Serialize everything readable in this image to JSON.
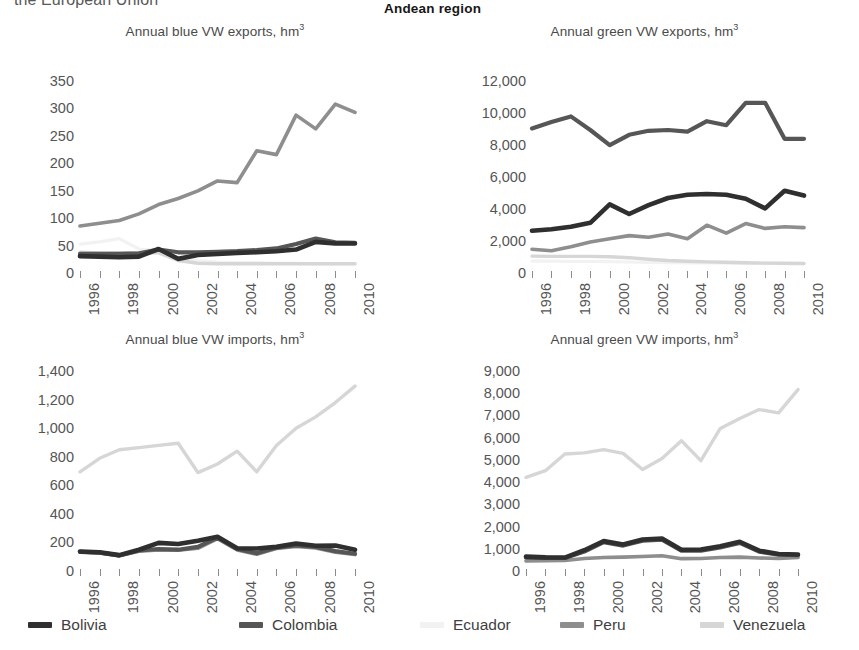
{
  "header": {
    "left_text": "the European Union",
    "right_text": "Andean region"
  },
  "legend": {
    "items": [
      {
        "label": "Bolivia",
        "color": "#2f2f2f"
      },
      {
        "label": "Colombia",
        "color": "#565656"
      },
      {
        "label": "Ecuador",
        "color": "#f2f2f2"
      },
      {
        "label": "Peru",
        "color": "#8e8e8e"
      },
      {
        "label": "Venezuela",
        "color": "#d6d6d6"
      }
    ]
  },
  "series_colors": {
    "Bolivia": "#2f2f2f",
    "Colombia": "#565656",
    "Ecuador": "#f2f2f2",
    "Peru": "#8e8e8e",
    "Venezuela": "#d6d6d6"
  },
  "x": [
    1996,
    1997,
    1998,
    1999,
    2000,
    2001,
    2002,
    2003,
    2004,
    2005,
    2006,
    2007,
    2008,
    2009,
    2010
  ],
  "x_tick_labels": [
    "1996",
    "",
    "1998",
    "",
    "2000",
    "",
    "2002",
    "",
    "2004",
    "",
    "2006",
    "",
    "2008",
    "",
    "2010"
  ],
  "chart_data": [
    {
      "id": "blue-exports",
      "type": "line",
      "title": "Annual blue VW exports, hm",
      "title_sup": "3",
      "xlabel": "",
      "ylabel": "",
      "ylim": [
        0,
        350
      ],
      "yticks": [
        0,
        50,
        100,
        150,
        200,
        250,
        300,
        350
      ],
      "ytick_labels": [
        "0",
        "50",
        "100",
        "150",
        "200",
        "250",
        "300",
        "350"
      ],
      "grid": false,
      "categories": [
        1996,
        1997,
        1998,
        1999,
        2000,
        2001,
        2002,
        2003,
        2004,
        2005,
        2006,
        2007,
        2008,
        2009,
        2010
      ],
      "series": [
        {
          "name": "Bolivia",
          "values": [
            18,
            17,
            16,
            17,
            31,
            13,
            20,
            22,
            24,
            25,
            27,
            30,
            44,
            41,
            41
          ]
        },
        {
          "name": "Colombia",
          "values": [
            22,
            22,
            22,
            23,
            30,
            25,
            25,
            26,
            27,
            29,
            32,
            40,
            50,
            43,
            42
          ]
        },
        {
          "name": "Ecuador",
          "values": [
            40,
            44,
            50,
            31,
            28,
            16,
            10,
            7,
            6,
            6,
            5,
            5,
            4,
            4,
            4
          ]
        },
        {
          "name": "Peru",
          "values": [
            73,
            78,
            83,
            95,
            112,
            123,
            137,
            155,
            152,
            210,
            203,
            275,
            250,
            295,
            280
          ]
        },
        {
          "name": "Venezuela",
          "values": [
            25,
            24,
            24,
            24,
            24,
            10,
            5,
            4,
            4,
            4,
            4,
            4,
            4,
            4,
            4
          ]
        }
      ]
    },
    {
      "id": "green-exports",
      "type": "line",
      "title": "Annual green VW exports, hm",
      "title_sup": "3",
      "xlabel": "",
      "ylabel": "",
      "ylim": [
        0,
        12000
      ],
      "yticks": [
        0,
        2000,
        4000,
        6000,
        8000,
        10000,
        12000
      ],
      "ytick_labels": [
        "0",
        "2,000",
        "4,000",
        "6,000",
        "8,000",
        "10,000",
        "12,000"
      ],
      "grid": false,
      "categories": [
        1996,
        1997,
        1998,
        1999,
        2000,
        2001,
        2002,
        2003,
        2004,
        2005,
        2006,
        2007,
        2008,
        2009,
        2010
      ],
      "series": [
        {
          "name": "Bolivia",
          "values": [
            2200,
            2300,
            2450,
            2700,
            3850,
            3250,
            3800,
            4250,
            4450,
            4500,
            4450,
            4200,
            3600,
            4700,
            4400
          ]
        },
        {
          "name": "Colombia",
          "values": [
            8600,
            9000,
            9350,
            8500,
            7550,
            8200,
            8450,
            8500,
            8400,
            9050,
            8800,
            10200,
            10200,
            7950,
            7950
          ]
        },
        {
          "name": "Ecuador",
          "values": [
            300,
            300,
            280,
            280,
            270,
            250,
            230,
            210,
            200,
            190,
            180,
            170,
            160,
            150,
            150
          ]
        },
        {
          "name": "Peru",
          "values": [
            1050,
            950,
            1200,
            1500,
            1700,
            1900,
            1800,
            2000,
            1700,
            2550,
            2050,
            2650,
            2350,
            2450,
            2400
          ]
        },
        {
          "name": "Venezuela",
          "values": [
            620,
            600,
            600,
            600,
            580,
            520,
            420,
            340,
            300,
            260,
            230,
            200,
            180,
            170,
            160
          ]
        }
      ]
    },
    {
      "id": "blue-imports",
      "type": "line",
      "title": "Annual blue VW imports, hm",
      "title_sup": "3",
      "xlabel": "",
      "ylabel": "",
      "ylim": [
        0,
        1400
      ],
      "yticks": [
        0,
        200,
        400,
        600,
        800,
        1000,
        1200,
        1400
      ],
      "ytick_labels": [
        "0",
        "200",
        "400",
        "600",
        "800",
        "1,000",
        "1,200",
        "1,400"
      ],
      "grid": false,
      "categories": [
        1996,
        1997,
        1998,
        1999,
        2000,
        2001,
        2002,
        2003,
        2004,
        2005,
        2006,
        2007,
        2008,
        2009,
        2010
      ],
      "series": [
        {
          "name": "Bolivia",
          "values": [
            88,
            82,
            62,
            100,
            148,
            140,
            163,
            190,
            110,
            108,
            120,
            143,
            128,
            130,
            100
          ]
        },
        {
          "name": "Colombia",
          "values": [
            85,
            80,
            60,
            95,
            105,
            100,
            120,
            185,
            105,
            75,
            115,
            130,
            120,
            90,
            72
          ]
        },
        {
          "name": "Ecuador",
          "values": [
            85,
            78,
            58,
            92,
            100,
            98,
            112,
            180,
            100,
            70,
            110,
            125,
            115,
            85,
            68
          ]
        },
        {
          "name": "Peru",
          "values": [
            84,
            77,
            57,
            90,
            98,
            96,
            110,
            178,
            98,
            68,
            108,
            122,
            112,
            83,
            66
          ]
        },
        {
          "name": "Venezuela",
          "values": [
            645,
            740,
            800,
            815,
            830,
            845,
            640,
            700,
            790,
            645,
            830,
            950,
            1030,
            1130,
            1245
          ]
        }
      ]
    },
    {
      "id": "green-imports",
      "type": "line",
      "title": "Annual green VW imports, hm",
      "title_sup": "3",
      "xlabel": "",
      "ylabel": "",
      "ylim": [
        0,
        9000
      ],
      "yticks": [
        0,
        1000,
        2000,
        3000,
        4000,
        5000,
        6000,
        7000,
        8000,
        9000
      ],
      "ytick_labels": [
        "0",
        "1,000",
        "2,000",
        "3,000",
        "4,000",
        "5,000",
        "6,000",
        "7,000",
        "8,000",
        "9,000"
      ],
      "grid": false,
      "categories": [
        1996,
        1997,
        1998,
        1999,
        2000,
        2001,
        2002,
        2003,
        2004,
        2005,
        2006,
        2007,
        2008,
        2009,
        2010
      ],
      "series": [
        {
          "name": "Bolivia",
          "values": [
            330,
            300,
            290,
            620,
            1030,
            880,
            1100,
            1150,
            640,
            650,
            800,
            1000,
            600,
            450,
            430
          ]
        },
        {
          "name": "Colombia",
          "values": [
            300,
            280,
            270,
            560,
            980,
            830,
            1050,
            1100,
            600,
            600,
            750,
            950,
            560,
            420,
            400
          ]
        },
        {
          "name": "Ecuador",
          "values": [
            150,
            160,
            170,
            260,
            300,
            320,
            350,
            380,
            250,
            260,
            300,
            320,
            280,
            260,
            300
          ]
        },
        {
          "name": "Peru",
          "values": [
            140,
            150,
            160,
            250,
            290,
            310,
            340,
            370,
            240,
            250,
            290,
            310,
            270,
            250,
            290
          ]
        },
        {
          "name": "Venezuela",
          "values": [
            3900,
            4200,
            4950,
            5000,
            5150,
            4980,
            4250,
            4750,
            5550,
            4650,
            6100,
            6550,
            6950,
            6800,
            7850
          ]
        }
      ]
    }
  ]
}
